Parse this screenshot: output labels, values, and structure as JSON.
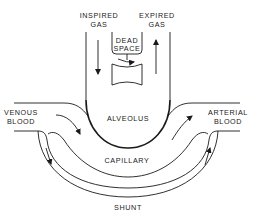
{
  "diagram": {
    "type": "physiology schematic",
    "labels": {
      "inspired_line1": "INSPIRED",
      "inspired_line2": "GAS",
      "expired_line1": "EXPIRED",
      "expired_line2": "GAS",
      "dead_line1": "DEAD",
      "dead_line2": "SPACE",
      "alveolus": "ALVEOLUS",
      "venous_line1": "VENOUS",
      "venous_line2": "BLOOD",
      "arterial_line1": "ARTERIAL",
      "arterial_line2": "BLOOD",
      "capillary": "CAPILLARY",
      "shunt": "SHUNT"
    },
    "colors": {
      "stroke": "#1a1a1a",
      "background": "#ffffff"
    }
  }
}
